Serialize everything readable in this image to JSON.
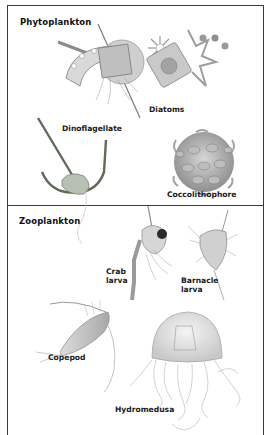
{
  "sections": {
    "phytoplankton": {
      "title": "Phytoplankton",
      "organisms": [
        {
          "name": "diatoms",
          "label": "Diatoms"
        },
        {
          "name": "dinoflagellate",
          "label": "Dinoflagellate"
        },
        {
          "name": "coccolithophore",
          "label": "Coccolithophore"
        }
      ]
    },
    "zooplankton": {
      "title": "Zooplankton",
      "organisms": [
        {
          "name": "crab-larva",
          "label_line1": "Crab",
          "label_line2": "larva"
        },
        {
          "name": "barnacle-larva",
          "label_line1": "Barnacle",
          "label_line2": "larva"
        },
        {
          "name": "copepod",
          "label": "Copepod"
        },
        {
          "name": "hydromedusa",
          "label": "Hydromedusa"
        }
      ]
    }
  },
  "colors": {
    "frame": "#3a3a3a",
    "text": "#1a1a1a",
    "diatom_gray": "#9a9a9a",
    "dinoflagellate_green": "#6f7d6a",
    "coccolith_gray": "#a8a8a8",
    "crustacean_gray": "#b5b5b5",
    "jelly_gray": "#bdbdbd"
  }
}
